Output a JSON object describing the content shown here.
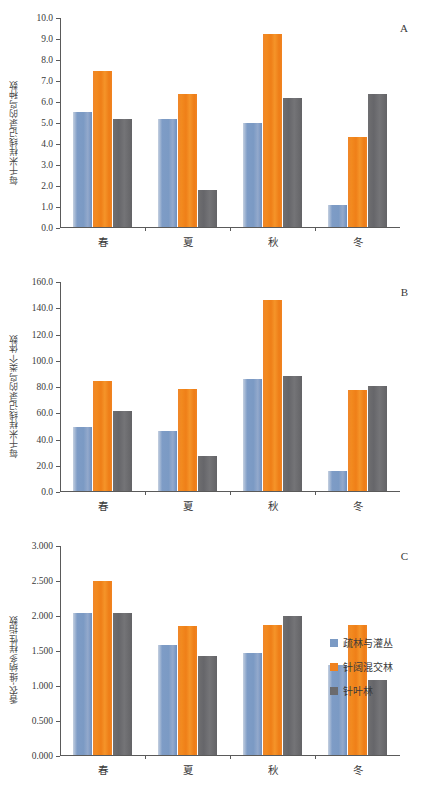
{
  "series_colors": {
    "open_forest_shrub": "#7b9ac4",
    "mixed_forest": "#f0821f",
    "coniferous_forest": "#6b6b6e"
  },
  "legend": {
    "items": [
      {
        "label": "疏林与灌丛",
        "color": "#7b9ac4"
      },
      {
        "label": "针阔混交林",
        "color": "#f0821f"
      },
      {
        "label": "针叶林",
        "color": "#6b6b6e"
      }
    ]
  },
  "panels": [
    {
      "letter": "A",
      "ylabel": "每千米样线记录的鸟种数",
      "ticks": [
        "10.0",
        "9.0",
        "8.0",
        "7.0",
        "6.0",
        "5.0",
        "4.0",
        "3.0",
        "2.0",
        "1.0",
        "0.0"
      ],
      "categories": [
        "春",
        "夏",
        "秋",
        "冬"
      ]
    },
    {
      "letter": "B",
      "ylabel": "每千米样线记录的鸟类个体数",
      "ticks": [
        "160.0",
        "140.0",
        "120.0",
        "100.0",
        "80.0",
        "60.0",
        "40.0",
        "20.0",
        "0.0"
      ],
      "categories": [
        "春",
        "夏",
        "秋",
        "冬"
      ]
    },
    {
      "letter": "C",
      "ylabel": "香农-维纳多样性指数",
      "ticks": [
        "3.000",
        "2.500",
        "2.000",
        "1.500",
        "1.000",
        "0.500",
        "0.000"
      ],
      "categories": [
        "春",
        "夏",
        "秋",
        "冬"
      ]
    }
  ],
  "chart_data": [
    {
      "type": "bar",
      "panel": "A",
      "title": "",
      "xlabel": "",
      "ylabel": "每千米样线记录的鸟种数",
      "categories": [
        "春",
        "夏",
        "秋",
        "冬"
      ],
      "ylim": [
        0,
        10
      ],
      "ytick_step": 1.0,
      "grid": false,
      "legend_position": "right",
      "series": [
        {
          "name": "疏林与灌丛",
          "color": "#7b9ac4",
          "values": [
            5.5,
            5.15,
            5.0,
            1.03
          ]
        },
        {
          "name": "针阔混交林",
          "color": "#f0821f",
          "values": [
            7.45,
            6.35,
            9.22,
            4.3
          ]
        },
        {
          "name": "针叶林",
          "color": "#6b6b6e",
          "values": [
            5.15,
            1.77,
            6.18,
            6.38
          ]
        }
      ]
    },
    {
      "type": "bar",
      "panel": "B",
      "title": "",
      "xlabel": "",
      "ylabel": "每千米样线记录的鸟类个体数",
      "categories": [
        "春",
        "夏",
        "秋",
        "冬"
      ],
      "ylim": [
        0,
        160
      ],
      "ytick_step": 20.0,
      "grid": false,
      "legend_position": "right",
      "series": [
        {
          "name": "疏林与灌丛",
          "color": "#7b9ac4",
          "values": [
            49.0,
            46.0,
            86.0,
            15.5
          ]
        },
        {
          "name": "针阔混交林",
          "color": "#f0821f",
          "values": [
            84.5,
            78.0,
            146.5,
            77.5
          ]
        },
        {
          "name": "针叶林",
          "color": "#6b6b6e",
          "values": [
            61.5,
            26.5,
            88.0,
            80.5
          ]
        }
      ]
    },
    {
      "type": "bar",
      "panel": "C",
      "title": "",
      "xlabel": "",
      "ylabel": "香农-维纳多样性指数",
      "categories": [
        "春",
        "夏",
        "秋",
        "冬"
      ],
      "ylim": [
        0,
        3.0
      ],
      "ytick_step": 0.5,
      "grid": false,
      "legend_position": "right",
      "series": [
        {
          "name": "疏林与灌丛",
          "color": "#7b9ac4",
          "values": [
            2.04,
            1.58,
            1.47,
            1.29
          ]
        },
        {
          "name": "针阔混交林",
          "color": "#f0821f",
          "values": [
            2.5,
            1.85,
            1.87,
            1.86
          ]
        },
        {
          "name": "针叶林",
          "color": "#6b6b6e",
          "values": [
            2.04,
            1.42,
            2.0,
            1.08
          ]
        }
      ]
    }
  ]
}
